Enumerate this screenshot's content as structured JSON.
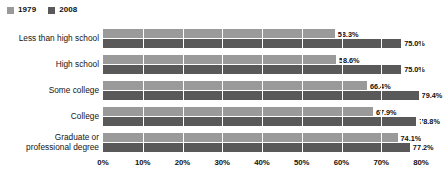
{
  "chart_data": {
    "type": "bar",
    "orientation": "horizontal",
    "title": "",
    "subtitle": "",
    "xlabel": "",
    "ylabel": "",
    "xlim": [
      0,
      80
    ],
    "grid": true,
    "gridlines_at": [
      0,
      10,
      20,
      30,
      40,
      50,
      60,
      70,
      80
    ],
    "legend_position": "top-left",
    "categories": [
      "Less than high school",
      "High school",
      "Some college",
      "College",
      "Graduate or\nprofessional degree"
    ],
    "series": [
      {
        "name": "1979",
        "color": "#9a9a9a",
        "values": [
          58.3,
          58.6,
          66.4,
          67.9,
          74.1
        ],
        "labels": [
          "58.3%",
          "58.6%",
          "66.4%",
          "67.9%",
          "74.1%"
        ]
      },
      {
        "name": "2008",
        "color": "#595959",
        "values": [
          75.0,
          75.0,
          79.4,
          78.8,
          77.2
        ],
        "labels": [
          "75.0%",
          "75.0%",
          "79.4%",
          "78.8%",
          "77.2%"
        ]
      }
    ],
    "xticks": [
      0,
      10,
      20,
      30,
      40,
      50,
      60,
      70,
      80
    ],
    "xticklabels": [
      "0%",
      "10%",
      "20%",
      "30%",
      "40%",
      "50%",
      "60%",
      "70%",
      "80%"
    ]
  },
  "legend": {
    "items": [
      {
        "label": "1979",
        "color": "#9a9a9a"
      },
      {
        "label": "2008",
        "color": "#595959"
      }
    ]
  }
}
